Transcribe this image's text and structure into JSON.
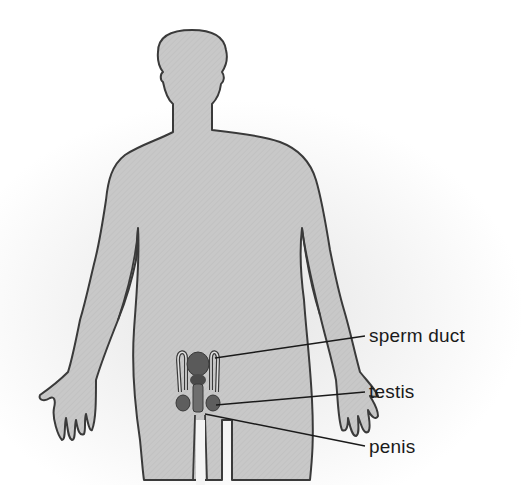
{
  "diagram": {
    "colors": {
      "body_fill": "#c9c9c9",
      "outline": "#3a3a3a",
      "organ_fill": "#6e6e6e",
      "organ_dark": "#4a4a4a",
      "background": "#ffffff"
    },
    "labels": [
      {
        "id": "sperm-duct",
        "text": "sperm duct"
      },
      {
        "id": "testis",
        "text": "testis"
      },
      {
        "id": "penis",
        "text": "penis"
      }
    ]
  }
}
